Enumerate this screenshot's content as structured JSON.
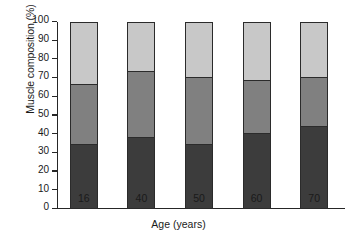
{
  "chart_data": {
    "type": "bar",
    "title": "",
    "subtitle": "",
    "xlabel": "Age (years)",
    "ylabel": "Muscle composition (%)",
    "categories": [
      "16",
      "40",
      "50",
      "60",
      "70"
    ],
    "ylim": [
      0,
      100
    ],
    "yticks": [
      0,
      10,
      20,
      30,
      40,
      50,
      60,
      70,
      80,
      90,
      100
    ],
    "ytick_labels": [
      "0",
      "10",
      "20",
      "30",
      "40",
      "50",
      "60",
      "70",
      "80",
      "90",
      "100"
    ],
    "grid": false,
    "legend": "none",
    "stacked": true,
    "series": [
      {
        "name": "bottom-segment",
        "color": "#3c3c3c",
        "values": [
          34,
          38,
          34,
          40,
          44
        ]
      },
      {
        "name": "middle-segment",
        "color": "#808080",
        "values": [
          33,
          36,
          37,
          29,
          27
        ]
      },
      {
        "name": "top-segment",
        "color": "#c8c8c8",
        "values": [
          33,
          26,
          29,
          31,
          29
        ]
      }
    ],
    "cumulative_tops": {
      "bottom": [
        34,
        38,
        34,
        40,
        44
      ],
      "middle": [
        67,
        74,
        71,
        69,
        71
      ],
      "top": [
        100,
        100,
        100,
        100,
        100
      ]
    }
  },
  "axes": {
    "y_title": "Muscle composition (%)",
    "x_title": "Age (years)"
  }
}
